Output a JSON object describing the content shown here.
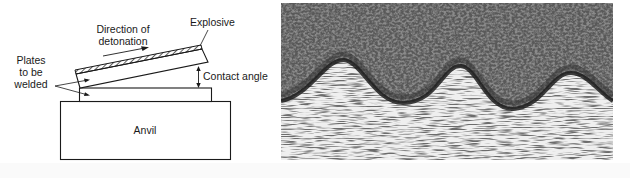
{
  "figure": {
    "schematic": {
      "labels": {
        "direction_line1": "Direction of",
        "direction_line2": "detonation",
        "explosive": "Explosive",
        "plates_line1": "Plates",
        "plates_line2": "to be",
        "plates_line3": "welded",
        "contact_angle": "Contact angle",
        "anvil": "Anvil"
      },
      "colors": {
        "stroke": "#1a1a1a",
        "fill": "#ffffff"
      }
    },
    "micrograph": {
      "description": "Wavy weld interface between two metals",
      "colors": {
        "upper_metal": "#4a4a4a",
        "lower_metal": "#ececec",
        "interface": "#1c1c1c"
      }
    }
  }
}
